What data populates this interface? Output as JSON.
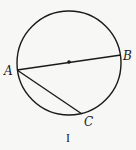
{
  "figure": {
    "caption": "I",
    "colors": {
      "stroke": "#1a1a1a",
      "background": "#f7f7f5"
    },
    "circle": {
      "cx": 69,
      "cy": 63,
      "r": 52
    },
    "center_point": {
      "x": 69,
      "y": 62
    },
    "points": [
      {
        "name": "A",
        "x": 17,
        "y": 70,
        "label_x": 4,
        "label_y": 75
      },
      {
        "name": "B",
        "x": 121,
        "y": 55,
        "label_x": 123,
        "label_y": 60
      },
      {
        "name": "C",
        "x": 82,
        "y": 114,
        "label_x": 84,
        "label_y": 126
      }
    ],
    "segments": [
      {
        "name": "AB",
        "from": "A",
        "to": "B",
        "note": "diameter through center"
      },
      {
        "name": "AC",
        "from": "A",
        "to": "C",
        "note": "chord"
      }
    ]
  }
}
